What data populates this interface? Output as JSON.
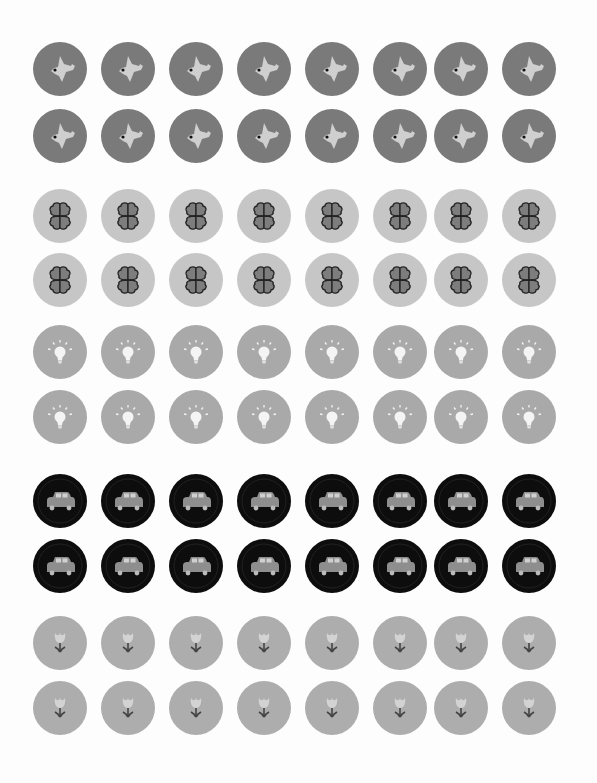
{
  "sheet": {
    "title": "Sticker sheet",
    "columns": 8,
    "column_x": [
      60,
      128,
      196,
      264,
      332,
      400,
      461,
      529
    ],
    "groups": [
      {
        "icon": "bird-icon",
        "bg": "#7a7a7a",
        "fg": "#cfcfcf",
        "row_y": [
          69,
          136
        ]
      },
      {
        "icon": "clover-icon",
        "bg": "#c6c6c6",
        "fg": "#7d7d7d",
        "row_y": [
          216,
          280
        ]
      },
      {
        "icon": "lightbulb-icon",
        "bg": "#a9a9a9",
        "fg": "#f4f4f4",
        "row_y": [
          352,
          417
        ]
      },
      {
        "icon": "car-icon",
        "bg": "#0d0d0d",
        "fg": "#8e8e8e",
        "row_y": [
          501,
          566
        ]
      },
      {
        "icon": "tulip-icon",
        "bg": "#adadad",
        "fg": "#d3d3d3",
        "row_y": [
          643,
          708
        ]
      }
    ]
  }
}
